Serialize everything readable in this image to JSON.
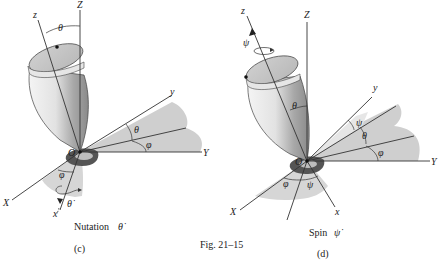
{
  "figure": {
    "caption": "Fig. 21–15",
    "panels": [
      {
        "id": "c",
        "label": "(c)",
        "title_word": "Nutation",
        "title_symbol": "θ̇",
        "axes": {
          "Z": "Z",
          "z": "z",
          "y": "y",
          "Y": "Y",
          "X": "X",
          "x": "x",
          "origin": "O"
        },
        "angles": {
          "theta_top": "θ",
          "theta_plane": "θ",
          "phi_plane": "φ",
          "phi_lower": "φ",
          "theta_dot": "θ̇"
        }
      },
      {
        "id": "d",
        "label": "(d)",
        "title_word": "Spin",
        "title_symbol": "ψ̇",
        "axes": {
          "Z": "Z",
          "z": "z",
          "y": "y",
          "Y": "Y",
          "X": "X",
          "x": "x",
          "origin": "O"
        },
        "angles": {
          "psi_top": "ψ",
          "theta_body": "θ",
          "psi_plane": "ψ",
          "theta_plane": "θ",
          "phi_plane": "φ",
          "phi_lower": "φ",
          "psi_lower": "ψ"
        }
      }
    ]
  },
  "colors": {
    "shade_light": "#d9d9d9",
    "shade_mid": "#c4c4c4",
    "shade_dark": "#555555",
    "line": "#333333"
  }
}
